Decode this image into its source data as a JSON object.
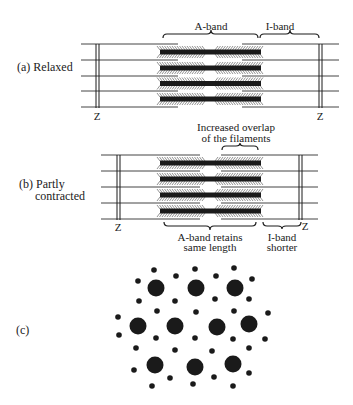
{
  "panel_a": {
    "label": "(a) Relaxed",
    "z_left": "Z",
    "z_right": "Z",
    "a_band": "A-band",
    "i_band": "I-band"
  },
  "panel_b": {
    "label_line1": "(b) Partly",
    "label_line2": "contracted",
    "z_left": "Z",
    "z_right": "Z",
    "overlap_line1": "Increased overlap",
    "overlap_line2": "of the filaments",
    "a_band_line1": "A-band retains",
    "a_band_line2": "same length",
    "i_band_line1": "I-band",
    "i_band_line2": "shorter"
  },
  "panel_c": {
    "label": "(c)"
  },
  "colors": {
    "ink": "#1a1a1a",
    "line": "#444444",
    "hatch": "#777777"
  }
}
